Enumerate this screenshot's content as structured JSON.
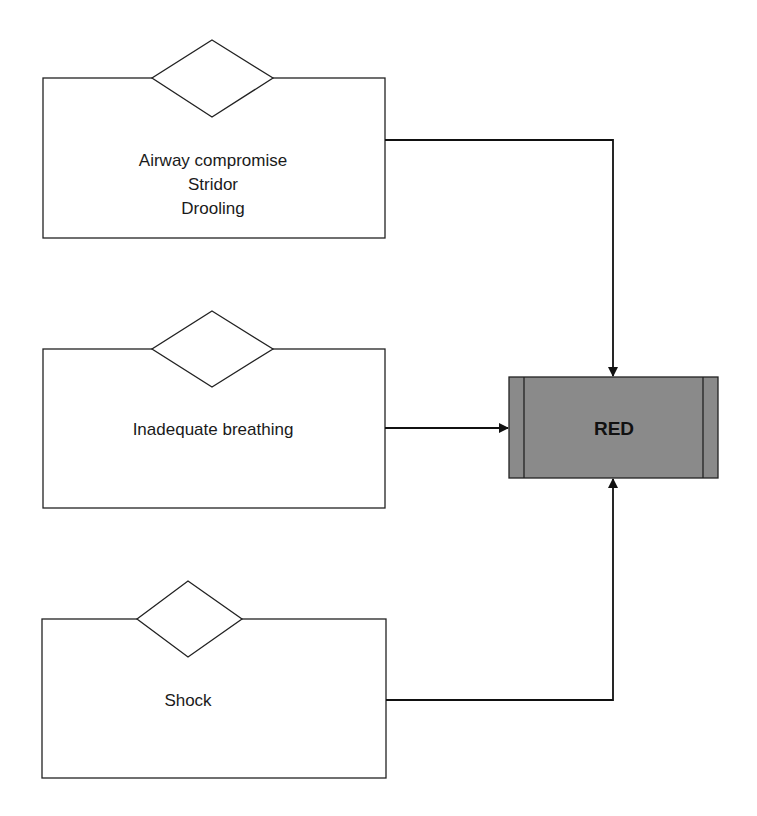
{
  "diagram": {
    "colors": {
      "stroke": "#222222",
      "box_fill": "#ffffff",
      "outcome_fill": "#8a8a8a"
    },
    "criteria": [
      {
        "id": "airway",
        "lines": [
          "Airway compromise",
          "Stridor",
          "Drooling"
        ]
      },
      {
        "id": "breathing",
        "lines": [
          "Inadequate breathing"
        ]
      },
      {
        "id": "shock",
        "lines": [
          "Shock"
        ]
      }
    ],
    "outcome": {
      "label": "RED"
    }
  }
}
